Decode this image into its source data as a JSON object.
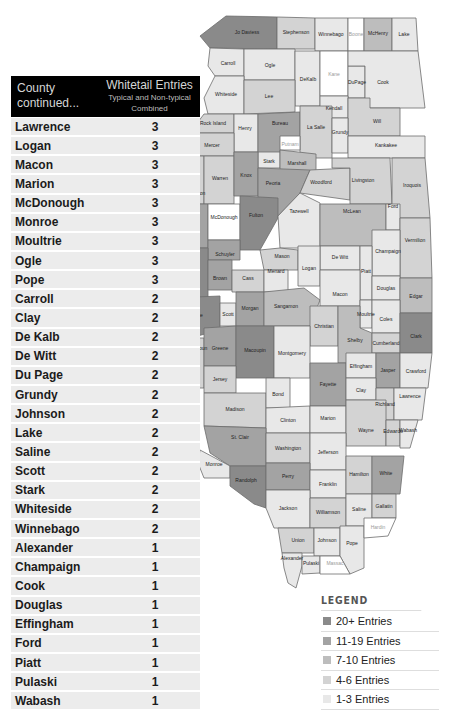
{
  "table": {
    "header": {
      "county": "County continued...",
      "entries_title": "Whitetail Entries",
      "entries_sub": "Typical and Non-typical Combined"
    },
    "rows": [
      {
        "county": "Lawrence",
        "entries": "3"
      },
      {
        "county": "Logan",
        "entries": "3"
      },
      {
        "county": "Macon",
        "entries": "3"
      },
      {
        "county": "Marion",
        "entries": "3"
      },
      {
        "county": "McDonough",
        "entries": "3"
      },
      {
        "county": "Monroe",
        "entries": "3"
      },
      {
        "county": "Moultrie",
        "entries": "3"
      },
      {
        "county": "Ogle",
        "entries": "3"
      },
      {
        "county": "Pope",
        "entries": "3"
      },
      {
        "county": "Carroll",
        "entries": "2"
      },
      {
        "county": "Clay",
        "entries": "2"
      },
      {
        "county": "De Kalb",
        "entries": "2"
      },
      {
        "county": "De Witt",
        "entries": "2"
      },
      {
        "county": "Du Page",
        "entries": "2"
      },
      {
        "county": "Grundy",
        "entries": "2"
      },
      {
        "county": "Johnson",
        "entries": "2"
      },
      {
        "county": "Lake",
        "entries": "2"
      },
      {
        "county": "Saline",
        "entries": "2"
      },
      {
        "county": "Scott",
        "entries": "2"
      },
      {
        "county": "Stark",
        "entries": "2"
      },
      {
        "county": "Whiteside",
        "entries": "2"
      },
      {
        "county": "Winnebago",
        "entries": "2"
      },
      {
        "county": "Alexander",
        "entries": "1"
      },
      {
        "county": "Champaign",
        "entries": "1"
      },
      {
        "county": "Cook",
        "entries": "1"
      },
      {
        "county": "Douglas",
        "entries": "1"
      },
      {
        "county": "Effingham",
        "entries": "1"
      },
      {
        "county": "Ford",
        "entries": "1"
      },
      {
        "county": "Piatt",
        "entries": "1"
      },
      {
        "county": "Pulaski",
        "entries": "1"
      },
      {
        "county": "Wabash",
        "entries": "1"
      }
    ]
  },
  "legend": {
    "title": "LEGEND",
    "items": [
      {
        "label": "20+ Entries",
        "color": "#8a8a8a"
      },
      {
        "label": "11-19 Entries",
        "color": "#a3a3a3"
      },
      {
        "label": "7-10 Entries",
        "color": "#bdbdbd"
      },
      {
        "label": "4-6 Entries",
        "color": "#d3d3d3"
      },
      {
        "label": "1-3 Entries",
        "color": "#e8e8e8"
      }
    ]
  },
  "map": {
    "title": "Illinois counties",
    "colors": {
      "t20": "#8a8a8a",
      "t11": "#a3a3a3",
      "t7": "#bdbdbd",
      "t4": "#d3d3d3",
      "t1": "#e8e8e8",
      "none": "#ffffff"
    },
    "labels": {
      "jodaviess": "Jo Daviess",
      "stephenson": "Stephenson",
      "winnebago": "Winnebago",
      "boone": "Boone",
      "mchenry": "McHenry",
      "lake": "Lake",
      "carroll": "Carroll",
      "ogle": "Ogle",
      "dekalb": "DeKalb",
      "kane": "Kane",
      "dupage": "DuPage",
      "cook": "Cook",
      "whiteside": "Whiteside",
      "lee": "Lee",
      "kendall": "Kendall",
      "will": "Will",
      "rockisland": "Rock Island",
      "henry": "Henry",
      "bureau": "Bureau",
      "lasalle": "La Salle",
      "grundy": "Grundy",
      "mercer": "Mercer",
      "putnam": "Putnam",
      "stark": "Stark",
      "marshall": "Marshall",
      "kankakee": "Kankakee",
      "henderson": "Henderson",
      "warren": "Warren",
      "knox": "Knox",
      "peoria": "Peoria",
      "woodford": "Woodford",
      "livingston": "Livingston",
      "iroquois": "Iroquois",
      "hancock": "Hancock",
      "mcdonough": "McDonough",
      "fulton": "Fulton",
      "tazewell": "Tazewell",
      "mclean": "McLean",
      "ford": "Ford",
      "schuyler": "Schuyler",
      "mason": "Mason",
      "dewitt": "De Witt",
      "champaign": "Champaign",
      "vermilion": "Vermilion",
      "adams": "Adams",
      "brown": "Brown",
      "cass": "Cass",
      "menard": "Menard",
      "logan": "Logan",
      "piatt": "Piatt",
      "pike": "Pike",
      "scott": "Scott",
      "morgan": "Morgan",
      "sangamon": "Sangamon",
      "macon": "Macon",
      "douglas": "Douglas",
      "edgar": "Edgar",
      "christian": "Christian",
      "moultrie": "Moultrie",
      "coles": "Coles",
      "calhoun": "Calhoun",
      "greene": "Greene",
      "macoupin": "Macoupin",
      "montgomery": "Montgomery",
      "shelby": "Shelby",
      "cumberland": "Cumberland",
      "clark": "Clark",
      "jersey": "Jersey",
      "fayette": "Fayette",
      "effingham": "Effingham",
      "jasper": "Jasper",
      "crawford": "Crawford",
      "madison": "Madison",
      "bond": "Bond",
      "clay": "Clay",
      "richland": "Richland",
      "lawrence": "Lawrence",
      "clinton": "Clinton",
      "marion": "Marion",
      "stclair": "St. Clair",
      "washington": "Washington",
      "wayne": "Wayne",
      "edwards": "Edwards",
      "wabash": "Wabash",
      "monroe": "Monroe",
      "jefferson": "Jefferson",
      "randolph": "Randolph",
      "perry": "Perry",
      "franklin": "Franklin",
      "hamilton": "Hamilton",
      "white": "White",
      "jackson": "Jackson",
      "williamson": "Williamson",
      "saline": "Saline",
      "gallatin": "Gallatin",
      "union": "Union",
      "johnson": "Johnson",
      "pope": "Pope",
      "hardin": "Hardin",
      "alexander": "Alexander",
      "pulaski": "Pulaski",
      "massac": "Massac"
    }
  }
}
